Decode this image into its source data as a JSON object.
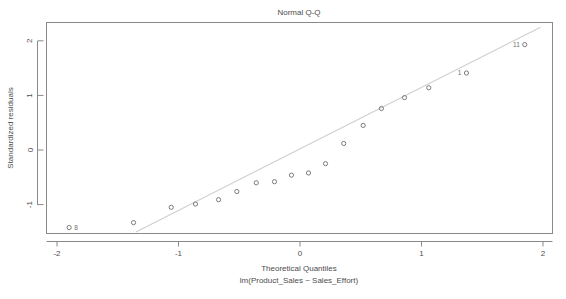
{
  "chart_data": {
    "type": "scatter",
    "title": "Normal Q-Q",
    "xlabel": "Theoretical Quantiles",
    "sublabel": "lm(Product_Sales ~ Sales_Effort)",
    "ylabel": "Standardized residuals",
    "xlim": [
      -2.12,
      2.08
    ],
    "ylim": [
      -1.55,
      2.28
    ],
    "xticks": [
      -2,
      -1,
      0,
      1,
      2
    ],
    "xticklabels": [
      "-2",
      "-1",
      "0",
      "1",
      "2"
    ],
    "yticks": [
      -1,
      0,
      1,
      2
    ],
    "yticklabels": [
      "-1",
      "0",
      "1",
      "2"
    ],
    "grid": false,
    "legend": null,
    "marker": "open-circle",
    "point_color": "#6e6e6e",
    "line_color": "#cfcfcf",
    "axis_color": "#8a8a8a",
    "reference_line": {
      "description": "theoretical quantile-quantile reference line",
      "x": [
        -1.35,
        1.98
      ],
      "y": [
        -1.5,
        2.25
      ]
    },
    "x": [
      -1.9,
      -1.37,
      -1.06,
      -0.86,
      -0.67,
      -0.52,
      -0.36,
      -0.21,
      -0.07,
      0.07,
      0.21,
      0.36,
      0.52,
      0.67,
      0.86,
      1.06,
      1.37,
      1.85
    ],
    "y": [
      -1.42,
      -1.33,
      -1.05,
      -0.99,
      -0.91,
      -0.76,
      -0.6,
      -0.58,
      -0.46,
      -0.42,
      -0.25,
      0.12,
      0.45,
      0.76,
      0.96,
      1.14,
      1.41,
      1.93
    ],
    "point_labels": [
      {
        "index": 0,
        "label": "8",
        "x": -1.9,
        "y": -1.42
      },
      {
        "index": 16,
        "label": "1",
        "x": 1.37,
        "y": 1.41
      },
      {
        "index": 17,
        "label": "11",
        "x": 1.85,
        "y": 1.93
      }
    ]
  }
}
